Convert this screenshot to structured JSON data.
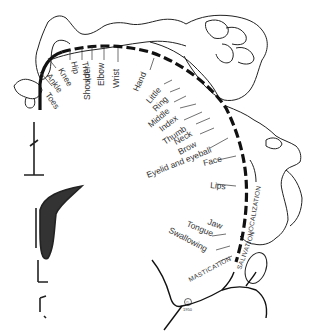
{
  "diagram": {
    "type": "motor homunculus",
    "leader_labels": [
      {
        "id": "toes",
        "text": "Toes"
      },
      {
        "id": "ankle",
        "text": "Ankle"
      },
      {
        "id": "knee",
        "text": "Knee"
      },
      {
        "id": "hip",
        "text": "Hip"
      },
      {
        "id": "trunk",
        "text": "Trunk"
      },
      {
        "id": "shoulder",
        "text": "Shoulder"
      },
      {
        "id": "elbow",
        "text": "Elbow"
      },
      {
        "id": "wrist",
        "text": "Wrist"
      },
      {
        "id": "hand",
        "text": "Hand"
      },
      {
        "id": "little",
        "text": "Little"
      },
      {
        "id": "ring",
        "text": "Ring"
      },
      {
        "id": "middle",
        "text": "Middle"
      },
      {
        "id": "index",
        "text": "Index"
      },
      {
        "id": "thumb",
        "text": "Thumb"
      },
      {
        "id": "neck",
        "text": "Neck"
      },
      {
        "id": "brow",
        "text": "Brow"
      },
      {
        "id": "eyelid",
        "text": "Eyelid and eyeball"
      },
      {
        "id": "face",
        "text": "Face"
      },
      {
        "id": "lips",
        "text": "Lips"
      },
      {
        "id": "jaw",
        "text": "Jaw"
      },
      {
        "id": "tongue",
        "text": "Tongue"
      },
      {
        "id": "swallowing",
        "text": "Swallowing"
      }
    ],
    "arc_labels": {
      "vocalization": "VOCALIZATION",
      "salivation": "SALIVATION",
      "mastication": "MASTICATION"
    },
    "copyright": "©",
    "year": "1950"
  }
}
